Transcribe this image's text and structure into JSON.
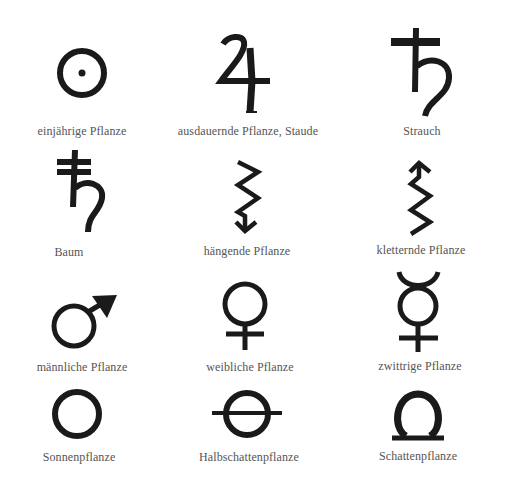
{
  "legend": {
    "items": [
      {
        "symbol": "circle-dot-icon",
        "label": "einjährige Pflanze"
      },
      {
        "symbol": "jupiter-icon",
        "label": "ausdauernde Pflanze, Staude"
      },
      {
        "symbol": "saturn-icon",
        "label": "Strauch"
      },
      {
        "symbol": "saturn-double-bar-icon",
        "label": "Baum"
      },
      {
        "symbol": "zigzag-down-arrow-icon",
        "label": "hängende Pflanze"
      },
      {
        "symbol": "zigzag-up-arrow-icon",
        "label": "kletternde Pflanze"
      },
      {
        "symbol": "mars-icon",
        "label": "männliche Pflanze"
      },
      {
        "symbol": "venus-icon",
        "label": "weibliche Pflanze"
      },
      {
        "symbol": "mercury-icon",
        "label": "zwittrige Pflanze"
      },
      {
        "symbol": "circle-icon",
        "label": "Sonnenpflanze"
      },
      {
        "symbol": "circle-bar-icon",
        "label": "Halbschattenpflanze"
      },
      {
        "symbol": "omega-icon",
        "label": "Schattenpflanze"
      }
    ]
  },
  "colors": {
    "symbol": "#1a1a1a",
    "label": "#555555",
    "background": "#ffffff"
  }
}
